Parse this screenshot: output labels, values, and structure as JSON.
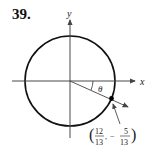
{
  "problem_number": "39.",
  "axes": {
    "x_label": "x",
    "y_label": "y"
  },
  "angle_label": "θ",
  "point": {
    "x_num": "12",
    "x_den": "13",
    "y_sign": "−",
    "y_num": "5",
    "y_den": "13"
  },
  "colors": {
    "stroke": "#111111",
    "arrow": "#444444"
  }
}
